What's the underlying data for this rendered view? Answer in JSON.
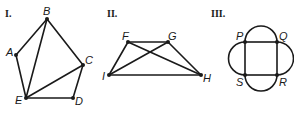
{
  "figures": [
    {
      "label": "I.",
      "vertices": {
        "A": "A",
        "B": "B",
        "C": "C",
        "D": "D",
        "E": "E"
      },
      "edges": [
        "AB",
        "BC",
        "CD",
        "DE",
        "EA",
        "EB",
        "EC"
      ]
    },
    {
      "label": "II.",
      "vertices": {
        "F": "F",
        "G": "G",
        "H": "H",
        "I": "I"
      },
      "edges": [
        "FG",
        "IH",
        "IF",
        "GH",
        "IG",
        "FH"
      ]
    },
    {
      "label": "III.",
      "vertices": {
        "P": "P",
        "Q": "Q",
        "R": "R",
        "S": "S"
      },
      "edges": [
        "PQ",
        "QR",
        "RS",
        "SP",
        "arc-PQ",
        "arc-QR",
        "arc-RS",
        "arc-SP"
      ]
    }
  ]
}
